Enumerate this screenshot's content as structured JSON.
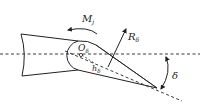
{
  "diagram": {
    "type": "control-surface-hinge-moment",
    "labels": {
      "moment": {
        "main": "M",
        "sub": "j"
      },
      "force": {
        "main": "R",
        "sub": "δ"
      },
      "hinge": {
        "main": "O",
        "sub": "δ"
      },
      "arm": {
        "main": "h",
        "sub": "δ"
      },
      "angle": "δ"
    },
    "colors": {
      "stroke": "#222222",
      "background": "#ffffff"
    }
  }
}
